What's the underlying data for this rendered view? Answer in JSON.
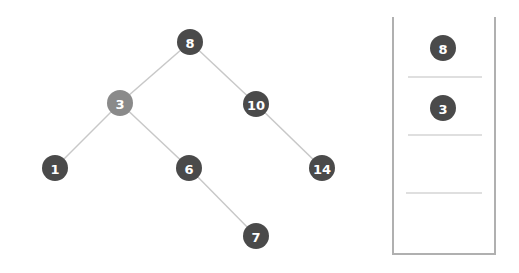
{
  "diagram": {
    "type": "binary-search-tree-with-stack",
    "colors": {
      "node": "#4a4a4a",
      "node_highlight": "#8a8a8a",
      "edge": "#c8c8c8",
      "stack_border": "#b0b0b0",
      "stack_divider": "#c0c0c0",
      "label": "#ffffff"
    },
    "tree": {
      "nodes": [
        {
          "id": "n8",
          "label": "8",
          "x": 190,
          "y": 42,
          "highlight": false
        },
        {
          "id": "n3",
          "label": "3",
          "x": 120,
          "y": 103,
          "highlight": true
        },
        {
          "id": "n10",
          "label": "10",
          "x": 256,
          "y": 104,
          "highlight": false
        },
        {
          "id": "n1",
          "label": "1",
          "x": 55,
          "y": 168,
          "highlight": false
        },
        {
          "id": "n6",
          "label": "6",
          "x": 189,
          "y": 168,
          "highlight": false
        },
        {
          "id": "n14",
          "label": "14",
          "x": 322,
          "y": 168,
          "highlight": false
        },
        {
          "id": "n7",
          "label": "7",
          "x": 256,
          "y": 236,
          "highlight": false
        }
      ],
      "edges": [
        [
          "n8",
          "n3"
        ],
        [
          "n8",
          "n10"
        ],
        [
          "n3",
          "n1"
        ],
        [
          "n3",
          "n6"
        ],
        [
          "n10",
          "n14"
        ],
        [
          "n6",
          "n7"
        ]
      ]
    },
    "stack": {
      "items": [
        {
          "label": "8"
        },
        {
          "label": "3"
        },
        {
          "label": ""
        },
        {
          "label": ""
        }
      ]
    }
  }
}
